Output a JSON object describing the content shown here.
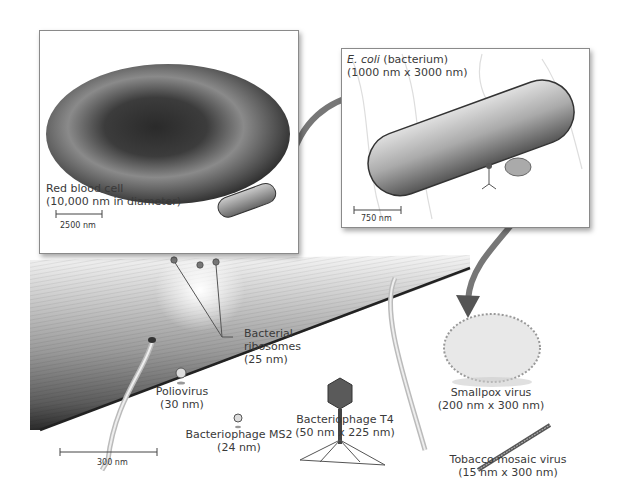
{
  "diagram": {
    "type": "relative-size-comparison",
    "panels": [
      {
        "id": "red-blood-cell-panel",
        "label_line1": "Red blood cell",
        "label_line2": "(10,000 nm in diameter)",
        "scale_bar": "2500 nm"
      },
      {
        "id": "ecoli-panel",
        "label_italic": "E. coli",
        "label_rest": " (bacterium)",
        "label_line2": "(1000 nm x 3000 nm)",
        "scale_bar": "750 nm"
      }
    ],
    "main_scale_bar": "300 nm",
    "items": [
      {
        "name": "Bacterial ribosomes",
        "line1": "Bacterial",
        "line2": "ribosomes",
        "line3": "(25 nm)"
      },
      {
        "name": "Poliovirus",
        "line1": "Poliovirus",
        "line2": "(30 nm)"
      },
      {
        "name": "Bacteriophage MS2",
        "line1": "Bacteriophage MS2",
        "line2": "(24 nm)"
      },
      {
        "name": "Bacteriophage T4",
        "line1": "Bacteriophage T4",
        "line2": "(50 nm x 225 nm)"
      },
      {
        "name": "Smallpox virus",
        "line1": "Smallpox virus",
        "line2": "(200 nm x 300 nm)"
      },
      {
        "name": "Tobacco mosaic virus",
        "line1": "Tobacco mosaic virus",
        "line2": "(15 nm x 300 nm)"
      }
    ],
    "colors": {
      "panel_border": "#8a8a8a",
      "arrow": "#555555",
      "cell_dark": "#2e2e2e",
      "cell_mid": "#7a7a7a",
      "text": "#3a3a3a"
    }
  }
}
